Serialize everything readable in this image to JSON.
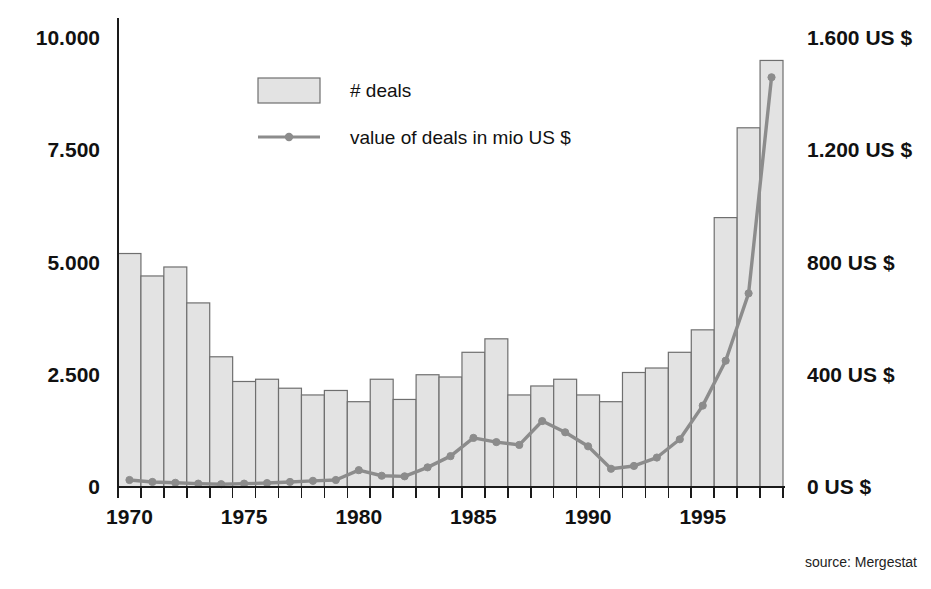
{
  "figure": {
    "source_note": "source: Mergestat",
    "background": "#ffffff",
    "bar_fill": "#e3e3e3",
    "bar_stroke": "#6f6f6f",
    "line_color": "#8c8c8c",
    "axis_color": "#1a1a1a"
  },
  "legend": {
    "position": "top-left-inside",
    "items": [
      {
        "label": "# deals",
        "marker": "swatch",
        "color": "#e3e3e3"
      },
      {
        "label": "value of deals in mio US $",
        "marker": "line-point",
        "color": "#8c8c8c"
      }
    ]
  },
  "chart_data": {
    "type": "bar",
    "title": "",
    "subtitle": "",
    "xlabel": "",
    "ylabel": "",
    "y2label": "",
    "grid": false,
    "legend_position": "top-left",
    "annotations": [
      "source: Mergestat"
    ],
    "x": [
      1970,
      1971,
      1972,
      1973,
      1974,
      1975,
      1976,
      1977,
      1978,
      1979,
      1980,
      1981,
      1982,
      1983,
      1984,
      1985,
      1986,
      1987,
      1988,
      1989,
      1990,
      1991,
      1992,
      1993,
      1994,
      1995,
      1996,
      1997,
      1998
    ],
    "categories": [
      "1970",
      "1971",
      "1972",
      "1973",
      "1974",
      "1975",
      "1976",
      "1977",
      "1978",
      "1979",
      "1980",
      "1981",
      "1982",
      "1983",
      "1984",
      "1985",
      "1986",
      "1987",
      "1988",
      "1989",
      "1990",
      "1991",
      "1992",
      "1993",
      "1994",
      "1995",
      "1996",
      "1997",
      "1998"
    ],
    "xtick_labels": [
      "1970",
      "1975",
      "1980",
      "1985",
      "1990",
      "1995"
    ],
    "xtick_values": [
      1970,
      1975,
      1980,
      1985,
      1990,
      1995
    ],
    "xlim": [
      1969.5,
      1998.5
    ],
    "ylim": [
      0,
      10000
    ],
    "ytick_labels": [
      "0",
      "2.500",
      "5.000",
      "7.500",
      "10.000"
    ],
    "ytick_values": [
      0,
      2500,
      5000,
      7500,
      10000
    ],
    "y2lim": [
      0,
      1600
    ],
    "y2tick_labels": [
      "0 US $",
      "400 US $",
      "800 US $",
      "1.200 US $",
      "1.600 US $"
    ],
    "y2tick_values": [
      0,
      400,
      800,
      1200,
      1600
    ],
    "series": [
      {
        "name": "# deals",
        "type": "bar",
        "axis": "left",
        "unit": "deals",
        "values": [
          5200,
          4700,
          4900,
          4100,
          2900,
          2350,
          2400,
          2200,
          2050,
          2150,
          1900,
          2400,
          1950,
          2500,
          2450,
          3000,
          3300,
          2050,
          2250,
          2400,
          2050,
          1900,
          2550,
          2650,
          3000,
          3500,
          6000,
          8000,
          9500
        ]
      },
      {
        "name": "value of deals in mio US $",
        "type": "line",
        "axis": "right",
        "unit": "mio US $",
        "values": [
          25,
          18,
          15,
          12,
          10,
          12,
          14,
          18,
          22,
          25,
          60,
          40,
          38,
          70,
          110,
          175,
          160,
          150,
          235,
          195,
          145,
          65,
          75,
          105,
          170,
          290,
          450,
          690,
          1460
        ]
      }
    ]
  }
}
